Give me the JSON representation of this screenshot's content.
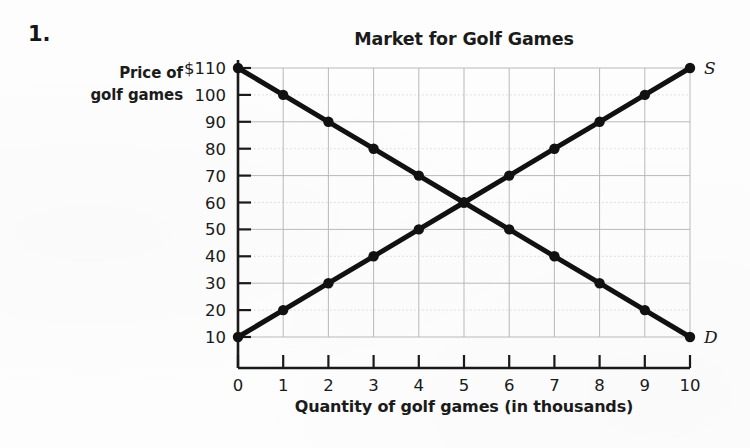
{
  "question_number": "1.",
  "chart_data": {
    "type": "line",
    "title": "Market for Golf Games",
    "xlabel": "Quantity of golf games (in thousands)",
    "ylabel": "Price of golf games",
    "ylabel_lines": [
      "Price of",
      "golf games"
    ],
    "x": [
      0,
      1,
      2,
      3,
      4,
      5,
      6,
      7,
      8,
      9,
      10
    ],
    "xlim": [
      0,
      10
    ],
    "ylim": [
      10,
      110
    ],
    "xticks": [
      "0",
      "1",
      "2",
      "3",
      "4",
      "5",
      "6",
      "7",
      "8",
      "9",
      "10"
    ],
    "yticks": [
      "$110",
      "100",
      "90",
      "80",
      "70",
      "60",
      "50",
      "40",
      "30",
      "20",
      "10"
    ],
    "ytick_values": [
      110,
      100,
      90,
      80,
      70,
      60,
      50,
      40,
      30,
      20,
      10
    ],
    "grid": true,
    "legend_position": "curve-end-labels",
    "series": [
      {
        "name": "Demand",
        "label": "D",
        "color": "#111111",
        "values": [
          110,
          100,
          90,
          80,
          70,
          60,
          50,
          40,
          30,
          20,
          10
        ]
      },
      {
        "name": "Supply",
        "label": "S",
        "color": "#111111",
        "values": [
          10,
          20,
          30,
          40,
          50,
          60,
          70,
          80,
          90,
          100,
          110
        ]
      }
    ],
    "equilibrium": {
      "quantity": 5,
      "price": 60
    }
  }
}
